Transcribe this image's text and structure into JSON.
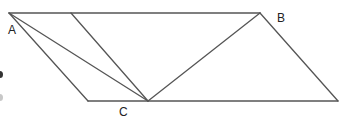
{
  "diagram": {
    "type": "geometry-figure",
    "labels": {
      "A": "A",
      "B": "B",
      "C": "C"
    },
    "stroke_color": "#555555",
    "points": {
      "A": [
        9,
        13
      ],
      "D": [
        71,
        13
      ],
      "B": [
        260,
        13
      ],
      "E": [
        88,
        101
      ],
      "C": [
        148,
        101
      ],
      "F": [
        338,
        101
      ]
    },
    "segments": [
      [
        "A",
        "B"
      ],
      [
        "E",
        "F"
      ],
      [
        "A",
        "E"
      ],
      [
        "B",
        "F"
      ],
      [
        "A",
        "C"
      ],
      [
        "D",
        "C"
      ],
      [
        "B",
        "C"
      ]
    ]
  }
}
